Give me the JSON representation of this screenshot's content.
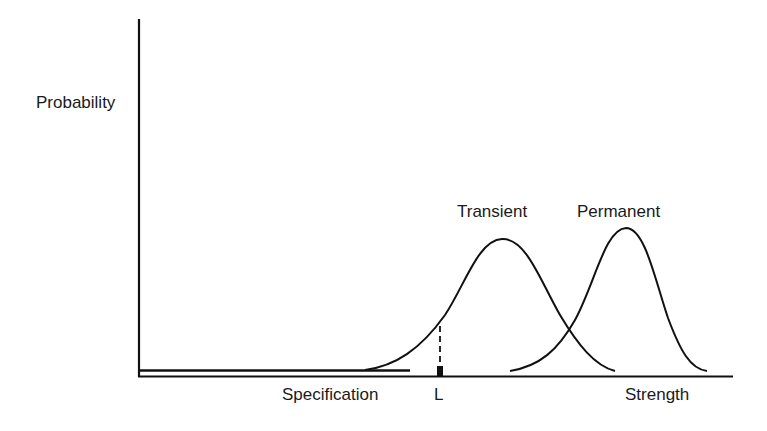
{
  "diagram": {
    "type": "strength-probability-distribution",
    "axes": {
      "y_label": "Probability",
      "x_label": "Strength"
    },
    "curves": [
      {
        "name": "Transient",
        "label": "Transient",
        "peak_x": 502,
        "peak_y": 239,
        "start_x": 365,
        "end_x": 615
      },
      {
        "name": "Permanent",
        "label": "Permanent",
        "peak_x": 626,
        "peak_y": 228,
        "start_x": 510,
        "end_x": 707
      }
    ],
    "markers": {
      "specification_label": "Specification",
      "limit_label": "L"
    },
    "colors": {
      "line": "#111111",
      "background": "#ffffff",
      "text": "#1a1a1a"
    }
  }
}
